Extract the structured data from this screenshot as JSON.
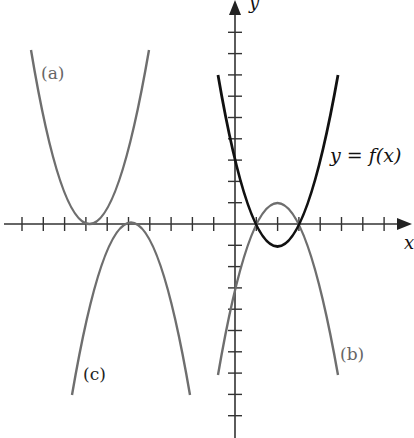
{
  "figure": {
    "axes": {
      "x_label": "x",
      "y_label": "y",
      "origin_px": [
        235,
        224
      ],
      "tick_spacing_px": 21.3,
      "x_ticks_left": 10,
      "x_ticks_right": 7,
      "y_ticks_up": 9,
      "y_ticks_down": 9
    },
    "curves": [
      {
        "id": "f",
        "label": "y = f(x)",
        "color": "#111111",
        "equation": "y = (x-2)^2 - 1"
      },
      {
        "id": "a",
        "label": "(a)",
        "color": "#6e6e6e",
        "equation": "y = (x+7)^2"
      },
      {
        "id": "b",
        "label": "(b)",
        "color": "#6e6e6e",
        "equation": "y = -(x-2)^2 + 1"
      },
      {
        "id": "c",
        "label": "(c)",
        "color": "#6e6e6e",
        "equation": "y = -(x+5)^2"
      }
    ],
    "colors": {
      "axis": "#333333",
      "primary_curve": "#111111",
      "secondary_curve": "#6e6e6e",
      "background": "#ffffff"
    }
  },
  "chart_data": {
    "type": "line",
    "title": "",
    "xlabel": "x",
    "ylabel": "y",
    "xlim": [
      -10,
      8
    ],
    "ylim": [
      -9,
      9
    ],
    "grid": false,
    "series": [
      {
        "name": "y = f(x)",
        "vertex": [
          2,
          -1
        ],
        "opens": "up",
        "x": [
          -0.8,
          0,
          1,
          2,
          3,
          4,
          5.2
        ],
        "y": [
          6.8,
          3,
          0,
          -1,
          0,
          3,
          9.2
        ]
      },
      {
        "name": "(a)",
        "vertex": [
          -7,
          0
        ],
        "opens": "up",
        "x": [
          -9.8,
          -8,
          -7,
          -6,
          -4.2
        ],
        "y": [
          7.8,
          1,
          0,
          1,
          7.8
        ]
      },
      {
        "name": "(b)",
        "vertex": [
          2,
          1
        ],
        "opens": "down",
        "x": [
          -0.8,
          0,
          1,
          2,
          3,
          4,
          5.2
        ],
        "y": [
          -6.8,
          -3,
          0,
          1,
          0,
          -3,
          -9.2
        ]
      },
      {
        "name": "(c)",
        "vertex": [
          -5,
          0
        ],
        "opens": "down",
        "x": [
          -7.8,
          -6,
          -5,
          -4,
          -2.2
        ],
        "y": [
          -7.8,
          -1,
          0,
          -1,
          -7.8
        ]
      }
    ],
    "annotations": [
      "(a)",
      "(b)",
      "(c)",
      "y = f(x)"
    ]
  }
}
